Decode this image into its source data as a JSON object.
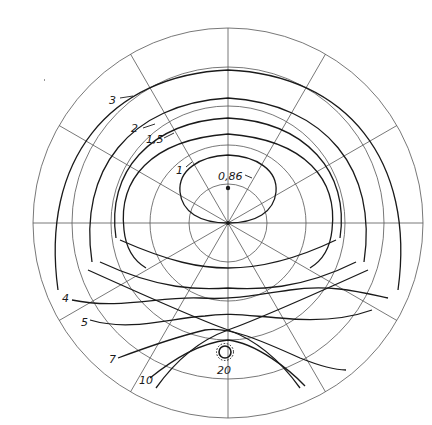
{
  "diagram": {
    "type": "polar-isoline-diagram",
    "center": [
      228,
      223
    ],
    "outer_radius": 195,
    "ring_count": 5,
    "radial_step_deg": 30,
    "center_marker_value": "0,86",
    "light_source_symbol": "sun-glyph",
    "isolines": [
      {
        "label": "0,86",
        "value": 0.86
      },
      {
        "label": "1",
        "value": 1
      },
      {
        "label": "1,5",
        "value": 1.5
      },
      {
        "label": "2",
        "value": 2
      },
      {
        "label": "3",
        "value": 3
      },
      {
        "label": "4",
        "value": 4
      },
      {
        "label": "5",
        "value": 5
      },
      {
        "label": "7",
        "value": 7
      },
      {
        "label": "10",
        "value": 10
      },
      {
        "label": "20",
        "value": 20
      }
    ]
  },
  "labels": {
    "l086": "0,86",
    "l1": "1",
    "l15": "1,5",
    "l2": "2",
    "l3": "3",
    "l4": "4",
    "l5": "5",
    "l7": "7",
    "l10": "10",
    "l20": "20"
  }
}
